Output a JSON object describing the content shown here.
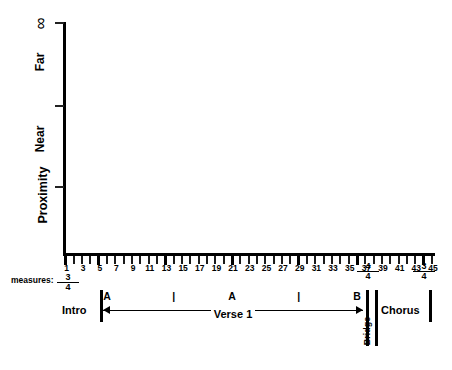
{
  "chart_data": {
    "type": "line",
    "title": "",
    "xlabel": "measures:",
    "ylabel": "Proximity",
    "grid": false,
    "legend": "none",
    "xlim": [
      1,
      45
    ],
    "x_ticks": [
      1,
      2,
      3,
      4,
      5,
      6,
      7,
      8,
      9,
      10,
      11,
      12,
      13,
      14,
      15,
      16,
      17,
      18,
      19,
      20,
      21,
      22,
      23,
      24,
      25,
      26,
      27,
      28,
      29,
      30,
      31,
      32,
      33,
      34,
      35,
      36,
      37,
      38,
      39,
      40,
      41,
      42,
      43,
      44,
      45
    ],
    "x_tick_labels": [
      "1",
      "",
      "3",
      "",
      "5",
      "",
      "7",
      "",
      "9",
      "",
      "11",
      "",
      "13",
      "",
      "15",
      "",
      "17",
      "",
      "19",
      "",
      "21",
      "",
      "23",
      "",
      "25",
      "",
      "27",
      "",
      "29",
      "",
      "31",
      "",
      "33",
      "",
      "35",
      "",
      "37",
      "",
      "39",
      "",
      "41",
      "",
      "43",
      "",
      "45"
    ],
    "x_major_ticks": [
      1,
      5,
      13,
      21,
      29,
      36,
      44
    ],
    "y_tick_labels": [
      "∞",
      "Far",
      "Near"
    ],
    "series": []
  },
  "axes": {
    "y_title": "Proximity",
    "y_labels": [
      {
        "text": "∞",
        "name": "y-tick-label-infinity"
      },
      {
        "text": "Far",
        "name": "y-tick-label-far"
      },
      {
        "text": "Near",
        "name": "y-tick-label-near"
      }
    ],
    "x_caption": "measures:"
  },
  "time_signatures": [
    {
      "id": "start",
      "numerator": "3",
      "denominator": "4",
      "measure": 1
    },
    {
      "id": "bridge",
      "numerator": "4",
      "denominator": "4",
      "measure": 36
    },
    {
      "id": "chorus",
      "numerator": "3",
      "denominator": "4",
      "measure": 44
    }
  ],
  "sections": {
    "intro": "Intro",
    "verse": "Verse 1",
    "bridge": "Bridge",
    "chorus": "Chorus"
  },
  "section_markers": [
    {
      "label": "A",
      "measure": 6
    },
    {
      "label": "|",
      "measure": 14
    },
    {
      "label": "A",
      "measure": 21
    },
    {
      "label": "|",
      "measure": 29
    },
    {
      "label": "B",
      "measure": 36
    }
  ],
  "colors": {
    "axis": "#000000",
    "text": "#000000",
    "background": "#ffffff"
  }
}
